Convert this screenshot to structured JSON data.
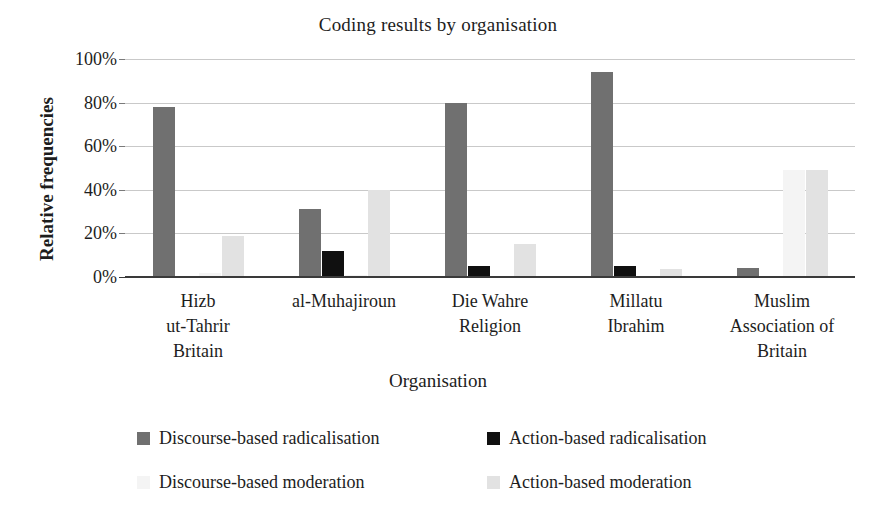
{
  "chart_data": {
    "type": "bar",
    "title": "Coding results by organisation",
    "xlabel": "Organisation",
    "ylabel": "Relative frequencies",
    "ylim": [
      0,
      100
    ],
    "yticks": [
      "0%",
      "20%",
      "40%",
      "60%",
      "80%",
      "100%"
    ],
    "grid": true,
    "legend_position": "bottom",
    "categories": [
      "Hizb ut-Tahrir Britain",
      "al-Muhajiroun",
      "Die Wahre Religion",
      "Millatu Ibrahim",
      "Muslim Association of Britain"
    ],
    "category_lines": [
      [
        "Hizb",
        "ut-Tahrir",
        "Britain"
      ],
      [
        "al-Muhajiroun"
      ],
      [
        "Die Wahre",
        "Religion"
      ],
      [
        "Millatu",
        "Ibrahim"
      ],
      [
        "Muslim",
        "Association of",
        "Britain"
      ]
    ],
    "series": [
      {
        "name": "Discourse-based radicalisation",
        "color": "#707070",
        "values": [
          78,
          31,
          80,
          94,
          4
        ]
      },
      {
        "name": "Action-based radicalisation",
        "color": "#101010",
        "values": [
          0,
          12,
          5,
          5,
          0
        ]
      },
      {
        "name": "Discourse-based moderation",
        "color": "#f4f4f4",
        "values": [
          2,
          1,
          0,
          0,
          49
        ]
      },
      {
        "name": "Action-based moderation",
        "color": "#e2e2e2",
        "values": [
          19,
          40,
          15,
          3.5,
          49
        ]
      }
    ]
  },
  "legend": {
    "items": [
      {
        "label": "Discourse-based radicalisation",
        "color": "#707070"
      },
      {
        "label": "Action-based radicalisation",
        "color": "#101010"
      },
      {
        "label": "Discourse-based moderation",
        "color": "#f4f4f4"
      },
      {
        "label": "Action-based moderation",
        "color": "#e2e2e2"
      }
    ]
  }
}
